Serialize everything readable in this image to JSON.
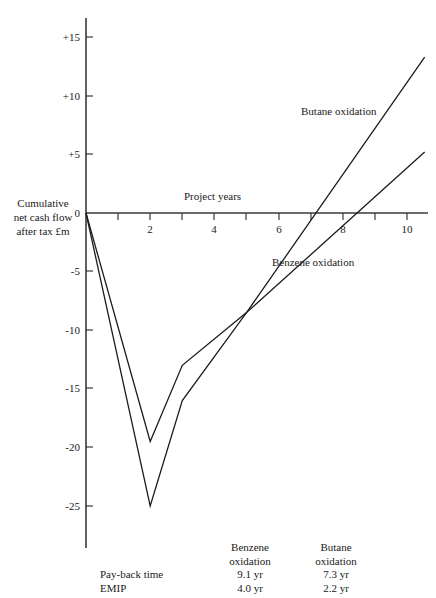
{
  "chart_data": {
    "type": "line",
    "title": "",
    "xlabel": "Project years",
    "ylabel": "Cumulative net cash flow after tax £m",
    "xlim": [
      0,
      10.6
    ],
    "ylim": [
      -27,
      16
    ],
    "grid": false,
    "legend_position": "inline-annotations",
    "x_ticks": [
      1,
      2,
      3,
      4,
      5,
      6,
      7,
      8,
      9,
      10
    ],
    "x_tick_labels": [
      "",
      "2",
      "",
      "4",
      "",
      "6",
      "",
      "8",
      "",
      "10"
    ],
    "y_ticks": [
      15,
      10,
      5,
      0,
      -5,
      -10,
      -15,
      -20,
      -25
    ],
    "y_tick_labels": [
      "+15",
      "+10",
      "+5",
      "0",
      "-5",
      "-10",
      "-15",
      "-20",
      "-25"
    ],
    "series": [
      {
        "name": "Butane oxidation",
        "x": [
          0,
          2,
          3,
          5,
          10.55
        ],
        "values": [
          0,
          -19.5,
          -13.0,
          -8.5,
          13.3
        ]
      },
      {
        "name": "Benzene oxidation",
        "x": [
          0,
          2,
          3,
          5,
          10.55
        ],
        "values": [
          0,
          -25.0,
          -16.0,
          -8.5,
          5.2
        ]
      }
    ],
    "annotations": [
      {
        "text": "Butane oxidation",
        "x": 7.2,
        "y": 10.6
      },
      {
        "text": "Benzene oxidation",
        "x": 5.9,
        "y": -3.7
      },
      {
        "text": "Project years",
        "x": 3.4,
        "y": 1.9
      }
    ]
  },
  "axis": {
    "y_title_line1": "Cumulative",
    "y_title_line2": "net cash flow",
    "y_title_line3": "after tax £m",
    "x_title": "Project years"
  },
  "series_labels": {
    "butane": "Butane oxidation",
    "benzene": "Benzene oxidation"
  },
  "y_tick_labels": {
    "t0": "+15",
    "t1": "+10",
    "t2": "+5",
    "t3": "0",
    "t4": "-5",
    "t5": "-10",
    "t6": "-15",
    "t7": "-20",
    "t8": "-25"
  },
  "x_tick_labels": {
    "t2": "2",
    "t4": "4",
    "t6": "6",
    "t8": "8",
    "t10": "10"
  },
  "summary_table": {
    "col_benzene_line1": "Benzene",
    "col_benzene_line2": "oxidation",
    "col_butane_line1": "Butane",
    "col_butane_line2": "oxidation",
    "row1_label": "Pay-back time",
    "row2_label": "EMIP",
    "row1_benzene": "9.1 yr",
    "row1_butane": "7.3 yr",
    "row2_benzene": "4.0 yr",
    "row2_butane": "2.2 yr"
  },
  "colors": {
    "axis": "#3a3a3a",
    "line": "#1c1c1c",
    "text": "#1a1a1a",
    "background": "#ffffff"
  }
}
